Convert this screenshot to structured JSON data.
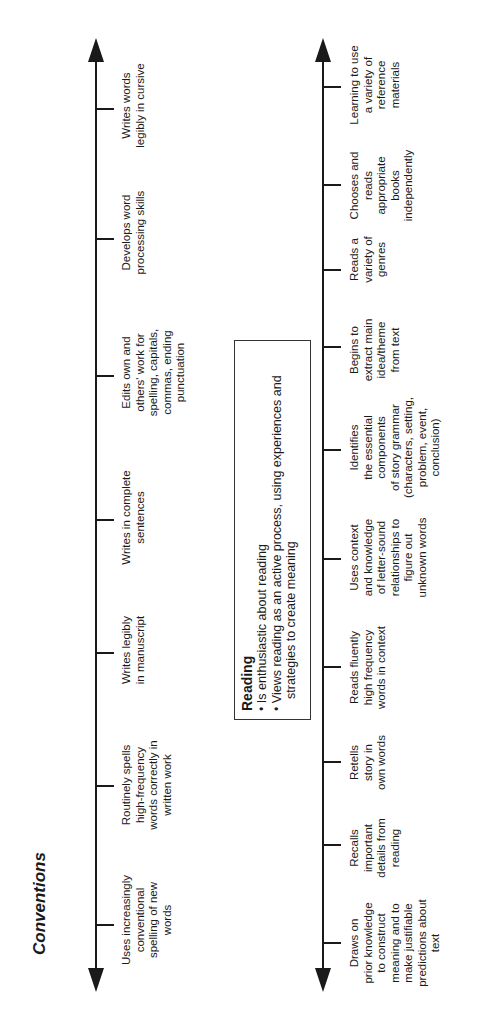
{
  "conventions": {
    "title": "Conventions",
    "items": [
      {
        "label": "Uses increasingly\nconventional\nspelling of new\nwords"
      },
      {
        "label": "Routinely spells\nhigh-frequency\nwords correctly in\nwritten work"
      },
      {
        "label": "Writes legibly\nin manuscript"
      },
      {
        "label": "Writes in complete\nsentences"
      },
      {
        "label": "Edits own and\nothers' work for\nspelling, capitals,\ncommas, ending\npunctuation"
      },
      {
        "label": "Develops word\nprocessing skills"
      },
      {
        "label": "Writes words\nlegibly in cursive"
      }
    ]
  },
  "reading_box": {
    "title": "Reading",
    "bullets": [
      "Is enthusiastic about reading",
      "Views reading as an active process, using experiences and strategies to create meaning"
    ]
  },
  "reading": {
    "items": [
      {
        "label": "Draws on\nprior knowledge\nto construct\nmeaning and to\nmake justifiable\npredictions about\ntext"
      },
      {
        "label": "Recalls\nimportant\ndetails from\nreading"
      },
      {
        "label": "Retells\nstory in\nown words"
      },
      {
        "label": "Reads fluently\nhigh frequency\nwords in context"
      },
      {
        "label": "Uses context\nand knowledge\nof letter-sound\nrelationships to\nfigure out\nunknown words"
      },
      {
        "label": "Identifies\nthe essential\ncomponents\nof story grammar\n(characters, setting,\nproblem, event,\nconclusion)"
      },
      {
        "label": "Begins to\nextract main\nidea/theme\nfrom text"
      },
      {
        "label": "Reads a\nvariety of\ngenres"
      },
      {
        "label": "Chooses and\nreads\nappropriate\nbooks\nindependently"
      },
      {
        "label": "Learning to use\na variety of\nreference\nmaterials"
      }
    ]
  }
}
